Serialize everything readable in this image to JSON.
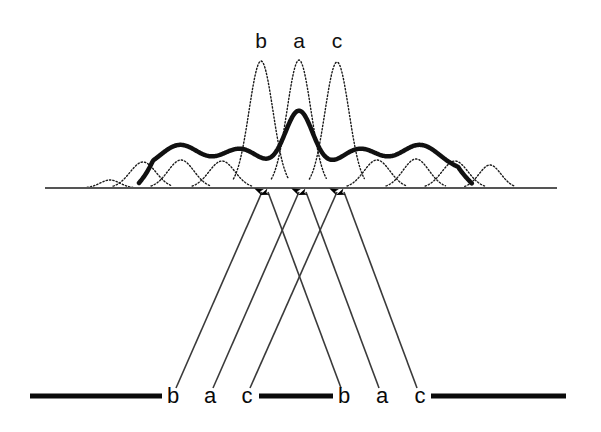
{
  "figure": {
    "title": "",
    "background_color": "#ffffff",
    "width": 601,
    "height": 432,
    "baseline": {
      "name": "horizontal-axis",
      "x_start": 45,
      "x_end": 557,
      "y": 188,
      "color": "#555555",
      "stroke_width": 2
    },
    "top_labels": [
      {
        "text": "b",
        "x": 261,
        "y": 48
      },
      {
        "text": "a",
        "x": 299,
        "y": 48
      },
      {
        "text": "c",
        "x": 337,
        "y": 48
      }
    ],
    "bottom_labels": [
      {
        "text": "b",
        "x": 173,
        "y": 403
      },
      {
        "text": "a",
        "x": 210,
        "y": 403
      },
      {
        "text": "c",
        "x": 247,
        "y": 403
      },
      {
        "text": "b",
        "x": 344,
        "y": 403
      },
      {
        "text": "a",
        "x": 382,
        "y": 403
      },
      {
        "text": "c",
        "x": 420,
        "y": 403
      }
    ],
    "bottom_rule_segments": [
      {
        "x_start": 30,
        "x_end": 162,
        "y": 396
      },
      {
        "x_start": 259,
        "x_end": 333,
        "y": 396
      },
      {
        "x_start": 431,
        "x_end": 566,
        "y": 396
      }
    ],
    "bottom_rule": {
      "color": "#0a0a0a",
      "stroke_width": 5
    },
    "arrows": {
      "count": 6,
      "color": "#3a3a3a",
      "stroke_width": 1.6,
      "head_color": "#000000",
      "items": [
        {
          "name": "arrow-b1",
          "x_tail": 176,
          "y_tail": 388,
          "x_head": 262,
          "y_head": 192
        },
        {
          "name": "arrow-a1",
          "x_tail": 213,
          "y_tail": 388,
          "x_head": 299,
          "y_head": 192
        },
        {
          "name": "arrow-c1",
          "x_tail": 250,
          "y_tail": 388,
          "x_head": 337,
          "y_head": 192
        },
        {
          "name": "arrow-b2",
          "x_tail": 341,
          "y_tail": 388,
          "x_head": 268,
          "y_head": 192
        },
        {
          "name": "arrow-a2",
          "x_tail": 379,
          "y_tail": 388,
          "x_head": 306,
          "y_head": 192
        },
        {
          "name": "arrow-c2",
          "x_tail": 417,
          "y_tail": 388,
          "x_head": 344,
          "y_head": 192
        }
      ]
    }
  },
  "chart_data": {
    "type": "line",
    "title": "",
    "xlabel": "",
    "ylabel": "",
    "grid": false,
    "legend": "none",
    "baseline_y": 188,
    "xlim": [
      45,
      557
    ],
    "series": [
      {
        "name": "dotted-components",
        "style": "dotted",
        "color": "#1a1a1a",
        "stroke_width": 1.4,
        "peaks": [
          {
            "center": 110,
            "height": 8,
            "width": 20
          },
          {
            "center": 143,
            "height": 26,
            "width": 26
          },
          {
            "center": 181,
            "height": 28,
            "width": 26
          },
          {
            "center": 222,
            "height": 27,
            "width": 26
          },
          {
            "center": 261,
            "height": 127,
            "width": 24
          },
          {
            "center": 299,
            "height": 128,
            "width": 24
          },
          {
            "center": 337,
            "height": 126,
            "width": 24
          },
          {
            "center": 377,
            "height": 28,
            "width": 26
          },
          {
            "center": 416,
            "height": 29,
            "width": 26
          },
          {
            "center": 455,
            "height": 27,
            "width": 26
          },
          {
            "center": 490,
            "height": 23,
            "width": 22
          }
        ]
      },
      {
        "name": "solid-envelope",
        "style": "solid",
        "color": "#111111",
        "stroke_width": 4.5,
        "x_start": 139,
        "x_end": 472,
        "peaks": [
          {
            "center": 299,
            "height": 60,
            "width": 28
          },
          {
            "center": 180,
            "height": 26,
            "width": 40
          },
          {
            "center": 240,
            "height": 22,
            "width": 38
          },
          {
            "center": 360,
            "height": 22,
            "width": 38
          },
          {
            "center": 420,
            "height": 26,
            "width": 40
          }
        ],
        "floor_height": 17
      }
    ]
  }
}
